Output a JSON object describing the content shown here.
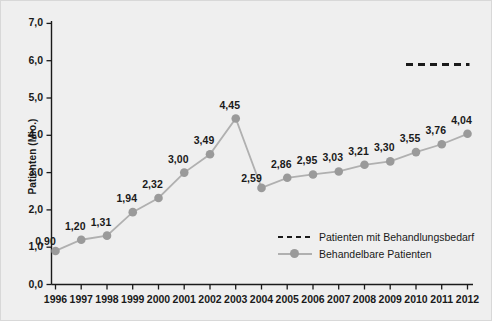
{
  "chart_data": {
    "type": "line",
    "title": "",
    "xlabel": "",
    "ylabel": "Patienten (Mio.)",
    "ylim": [
      0,
      7
    ],
    "yticks": [
      "0,0",
      "1,0",
      "2,0",
      "3,0",
      "4,0",
      "5,0",
      "6,0",
      "7,0"
    ],
    "ytick_values": [
      0,
      1,
      2,
      3,
      4,
      5,
      6,
      7
    ],
    "grid": false,
    "legend_position": "inside-bottom-right",
    "categories": [
      "1996",
      "1997",
      "1998",
      "1999",
      "2000",
      "2001",
      "2002",
      "2003",
      "2004",
      "2005",
      "2006",
      "2007",
      "2008",
      "2009",
      "2010",
      "2011",
      "2012"
    ],
    "series": [
      {
        "name": "Behandelbare Patienten",
        "style": "solid-with-markers",
        "color": "#9a9a9a",
        "values": [
          0.9,
          1.2,
          1.31,
          1.94,
          2.32,
          3.0,
          3.49,
          4.45,
          2.59,
          2.86,
          2.95,
          3.03,
          3.21,
          3.3,
          3.55,
          3.76,
          4.04
        ],
        "labels": [
          "0,90",
          "1,20",
          "1,31",
          "1,94",
          "2,32",
          "3,00",
          "3,49",
          "4,45",
          "2,59",
          "2,86",
          "2,95",
          "3,03",
          "3,21",
          "3,30",
          "3,55",
          "3,76",
          "4,04"
        ]
      },
      {
        "name": "Patienten mit Behandlungsbedarf",
        "style": "dashed",
        "color": "#1a1a1a",
        "x_range": [
          "2010",
          "2012"
        ],
        "value": 5.9,
        "values": [
          null,
          null,
          null,
          null,
          null,
          null,
          null,
          null,
          null,
          null,
          null,
          null,
          null,
          null,
          5.9,
          5.9,
          5.9
        ]
      }
    ],
    "legend": [
      "Patienten mit Behandlungsbedarf",
      "Behandelbare Patienten"
    ],
    "colors": {
      "background": "#efefef",
      "axis": "#1a1a1a",
      "series_line": "#b0b0b0",
      "series_marker": "#9a9a9a",
      "dashed_series": "#1a1a1a",
      "text": "#1a1a1a"
    }
  }
}
